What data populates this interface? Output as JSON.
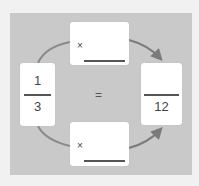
{
  "left_fraction": {
    "numerator": "1",
    "denominator": "3"
  },
  "right_fraction": {
    "numerator": "",
    "denominator": "12"
  },
  "equals_sign": "=",
  "top_multiplier": {
    "operator": "×",
    "value": ""
  },
  "bottom_multiplier": {
    "operator": "×",
    "value": ""
  },
  "colors": {
    "panel": "#c9c9c9",
    "background": "#f1f1f1",
    "arrow": "#7a7a7a",
    "card": "#ffffff"
  }
}
